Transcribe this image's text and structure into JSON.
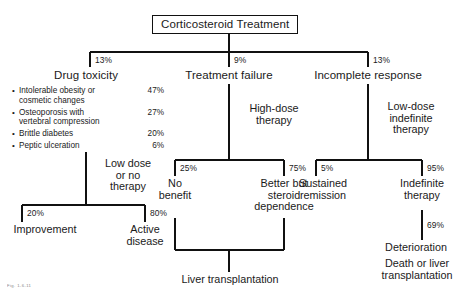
{
  "figure": {
    "type": "clinical-decision-flowchart",
    "caption_artifact": "Fig. 1-6-11",
    "root": {
      "label": "Corticosteroid Treatment"
    }
  },
  "branches": {
    "drug_toxicity": {
      "pct": "13%",
      "label": "Drug toxicity",
      "items": [
        {
          "text": "Intolerable obesity or\ncosmetic changes",
          "value": "47%"
        },
        {
          "text": "Osteoporosis with\nvertebral compression",
          "value": "27%"
        },
        {
          "text": "Brittle diabetes",
          "value": "20%"
        },
        {
          "text": "Peptic ulceration",
          "value": "6%"
        }
      ],
      "edge_label": "Low dose\nor no\ntherapy",
      "outcomes": [
        {
          "pct": "20%",
          "label": "Improvement"
        },
        {
          "pct": "80%",
          "label": "Active\ndisease"
        }
      ]
    },
    "treatment_failure": {
      "pct": "9%",
      "label": "Treatment failure",
      "edge_label": "High-dose\ntherapy",
      "outcomes": [
        {
          "pct": "25%",
          "label": "No\nbenefit"
        },
        {
          "pct": "75%",
          "label": "Better but\nsteroid\ndependence"
        }
      ],
      "terminal": "Liver transplantation"
    },
    "incomplete_response": {
      "pct": "13%",
      "label": "Incomplete response",
      "edge_label": "Low-dose\nindefinite\ntherapy",
      "outcomes": [
        {
          "pct": "5%",
          "label": "Sustained\nremission"
        },
        {
          "pct": "95%",
          "label": "Indefinite\ntherapy"
        }
      ],
      "sub_pct": "69%",
      "terminal_1": "Deterioration",
      "terminal_2": "Death or liver\ntransplantation"
    }
  },
  "colors": {
    "line": "#111111",
    "text": "#1a1a1a",
    "background": "#ffffff"
  }
}
